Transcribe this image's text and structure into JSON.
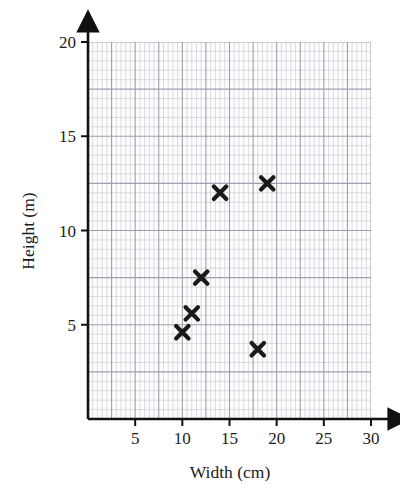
{
  "chart_data": {
    "type": "scatter",
    "title": "",
    "xlabel": "Width (cm)",
    "ylabel": "Height (m)",
    "xlim": [
      0,
      30
    ],
    "ylim": [
      0,
      20
    ],
    "xticks": [
      5,
      10,
      15,
      20,
      25,
      30
    ],
    "yticks": [
      5,
      10,
      15,
      20
    ],
    "xtick_labels": [
      "5",
      "10",
      "15",
      "20",
      "25",
      "30"
    ],
    "ytick_labels": [
      "5",
      "10",
      "15",
      "20"
    ],
    "grid": true,
    "grid_minor_step": 0.5,
    "grid_major_step": 2.5,
    "legend": "none",
    "marker": "x-cross",
    "marker_color": "#1a1a1a",
    "points": [
      {
        "x": 10,
        "y": 4.6
      },
      {
        "x": 11,
        "y": 5.6
      },
      {
        "x": 12,
        "y": 7.5
      },
      {
        "x": 14,
        "y": 12.0
      },
      {
        "x": 18,
        "y": 3.7
      },
      {
        "x": 19,
        "y": 12.5
      }
    ],
    "x": [
      10,
      11,
      12,
      14,
      18,
      19
    ],
    "values": [
      4.6,
      5.6,
      7.5,
      12.0,
      3.7,
      12.5
    ]
  },
  "colors": {
    "axis": "#111111",
    "grid_minor": "#c8ccd4",
    "grid_major": "#9aa0aa",
    "marker": "#1a1a1a",
    "background": "#ffffff",
    "plot_background": "#fdfdfd"
  }
}
